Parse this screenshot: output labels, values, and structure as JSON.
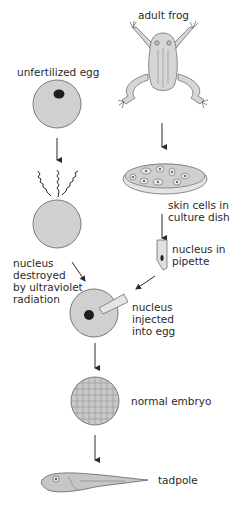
{
  "labels": {
    "adult_frog": "adult frog",
    "unfertilized_egg": "unfertilized egg",
    "skin_cells": "skin cells in\nculture dish",
    "nucleus_pipette": "nucleus in\npipette",
    "nucleus_destroyed": "nucleus\ndestroyed\nby ultraviolet\nradiation",
    "nucleus_injected": "nucleus\ninjected\ninto egg",
    "normal_embryo": "normal embryo",
    "tadpole": "tadpole"
  },
  "colors": {
    "fill": "#d0d0d0",
    "stroke": "#6e6e6e",
    "nucleus": "#1e1e1e",
    "text": "#2a2a2a",
    "arrow": "#2a2a2a"
  },
  "stages": [
    {
      "id": "adult-frog",
      "label_key": "adult_frog"
    },
    {
      "id": "skin-cells",
      "label_key": "skin_cells"
    },
    {
      "id": "nucleus-pipette",
      "label_key": "nucleus_pipette"
    },
    {
      "id": "unfertilized-egg",
      "label_key": "unfertilized_egg"
    },
    {
      "id": "uv-destroyed-egg",
      "label_key": "nucleus_destroyed"
    },
    {
      "id": "injected-egg",
      "label_key": "nucleus_injected"
    },
    {
      "id": "normal-embryo",
      "label_key": "normal_embryo"
    },
    {
      "id": "tadpole",
      "label_key": "tadpole"
    }
  ]
}
